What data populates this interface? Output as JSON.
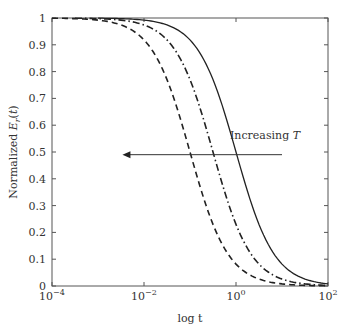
{
  "chart_data": {
    "type": "line",
    "title": "",
    "xlabel": "log t",
    "ylabel": "Normalized E_r(t)",
    "xscale": "log",
    "xlim": [
      0.0001,
      100
    ],
    "ylim": [
      0,
      1
    ],
    "x_ticks": [
      "10^-4",
      "10^-2",
      "10^0",
      "10^2"
    ],
    "y_ticks": [
      "0",
      "0.1",
      "0.2",
      "0.3",
      "0.4",
      "0.5",
      "0.6",
      "0.7",
      "0.8",
      "0.9",
      "1"
    ],
    "grid": false,
    "legend": null,
    "annotation": {
      "text": "Increasing T",
      "arrow": "left",
      "y": 0.49,
      "x_from": 10,
      "x_to": 0.0034
    },
    "series": [
      {
        "name": "Curve 1 (lowest T)",
        "style": "solid",
        "logt": [
          -3,
          -2.5,
          -2,
          -1.5,
          -1,
          -0.5,
          0,
          0.5,
          1,
          1.5,
          2
        ],
        "values": [
          0.97,
          0.955,
          0.93,
          0.88,
          0.79,
          0.66,
          0.5,
          0.31,
          0.12,
          0.02,
          0.0
        ]
      },
      {
        "name": "Curve 2",
        "style": "dashdot",
        "logt": [
          -3.5,
          -3,
          -2.5,
          -2,
          -1.5,
          -1,
          -0.5,
          0,
          0.5,
          1,
          1.5
        ],
        "values": [
          0.97,
          0.955,
          0.93,
          0.88,
          0.79,
          0.66,
          0.5,
          0.31,
          0.12,
          0.02,
          0.0
        ]
      },
      {
        "name": "Curve 3 (highest T)",
        "style": "dashed",
        "logt": [
          -4,
          -3.5,
          -3,
          -2.5,
          -2,
          -1.5,
          -1,
          -0.5,
          0,
          0.5,
          1
        ],
        "values": [
          0.97,
          0.955,
          0.93,
          0.88,
          0.79,
          0.66,
          0.5,
          0.31,
          0.12,
          0.02,
          0.0
        ]
      }
    ]
  }
}
